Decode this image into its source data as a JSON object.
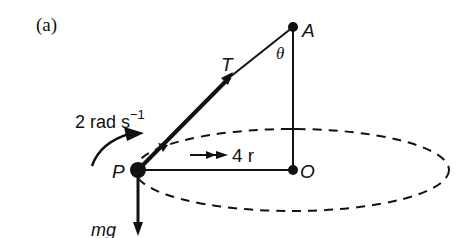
{
  "figure": {
    "panel_label": "(a)",
    "points": {
      "A": "A",
      "O": "O",
      "P": "P"
    },
    "labels": {
      "tension": "T",
      "angle": "θ",
      "angular_velocity_value": "2 rad s",
      "angular_velocity_exponent": "−1",
      "radius": "4 r",
      "weight": "mg"
    },
    "colors": {
      "ink": "#111111",
      "background": "#ffffff"
    }
  }
}
